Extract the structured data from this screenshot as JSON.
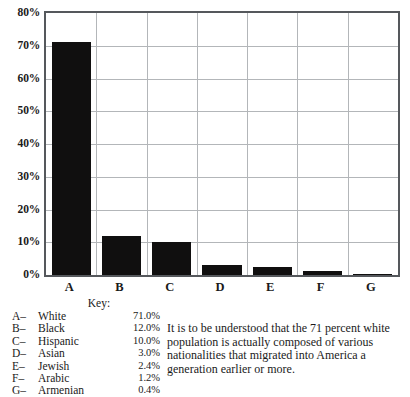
{
  "chart_data": {
    "type": "bar",
    "title": "",
    "subtitle": "",
    "xlabel": "",
    "ylabel": "",
    "categories": [
      "A",
      "B",
      "C",
      "D",
      "E",
      "F",
      "G"
    ],
    "values": [
      71.0,
      12.0,
      10.0,
      3.0,
      2.4,
      1.2,
      0.4
    ],
    "value_labels": [
      "71.0%",
      "12.0%",
      "10.0%",
      "3.0%",
      "2.4%",
      "1.2%",
      "0.4%"
    ],
    "series_names": [
      "White",
      "Black",
      "Hispanic",
      "Asian",
      "Jewish",
      "Arabic",
      "Armenian"
    ],
    "ylim": [
      0,
      80
    ],
    "ytick_values": [
      0,
      10,
      20,
      30,
      40,
      50,
      60,
      70,
      80
    ],
    "ytick_labels": [
      "0%",
      "10%",
      "20%",
      "30%",
      "40%",
      "50%",
      "60%",
      "70%",
      "80%"
    ],
    "grid": true,
    "grid_axes": "both",
    "legend_position": "below-left",
    "bar_color": "#100f0f",
    "grid_color": "#b3b6b9",
    "border_color": "#55585c",
    "background_color": "#ffffff"
  },
  "key": {
    "title": "Key:",
    "rows": [
      {
        "letter": "A–",
        "name": "White",
        "value": "71.0%"
      },
      {
        "letter": "B–",
        "name": "Black",
        "value": "12.0%"
      },
      {
        "letter": "C–",
        "name": "Hispanic",
        "value": "10.0%"
      },
      {
        "letter": "D–",
        "name": "Asian",
        "value": "3.0%"
      },
      {
        "letter": "E–",
        "name": "Jewish",
        "value": "2.4%"
      },
      {
        "letter": "F–",
        "name": "Arabic",
        "value": "1.2%"
      },
      {
        "letter": "G–",
        "name": "Armenian",
        "value": "0.4%"
      }
    ]
  },
  "note": {
    "text": "It is to be understood that the 71 percent white population is actually composed of various nationalities that migrated into America a generation earlier or more."
  }
}
